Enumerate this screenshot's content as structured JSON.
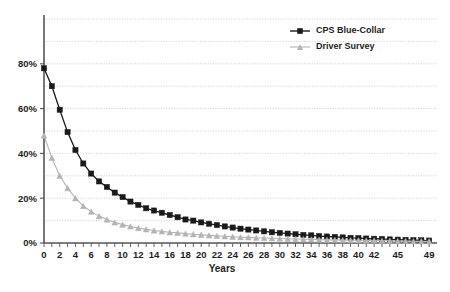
{
  "chart_data": {
    "type": "line",
    "title": "",
    "xlabel": "Years",
    "ylabel": "",
    "xlim": [
      0,
      50
    ],
    "ylim": [
      0,
      100
    ],
    "grid": true,
    "legend_position": "top-right",
    "x_tick_labels": [
      "0",
      "2",
      "4",
      "6",
      "8",
      "10",
      "12",
      "14",
      "16",
      "18",
      "20",
      "22",
      "24",
      "26",
      "28",
      "30",
      "32",
      "34",
      "36",
      "38",
      "40",
      "42",
      "45",
      "49"
    ],
    "x_tick_values": [
      0,
      2,
      4,
      6,
      8,
      10,
      12,
      14,
      16,
      18,
      20,
      22,
      24,
      26,
      28,
      30,
      32,
      34,
      36,
      38,
      40,
      42,
      45,
      49
    ],
    "y_tick_labels": [
      "0%",
      "20%",
      "40%",
      "60%",
      "80%"
    ],
    "y_tick_values": [
      0,
      20,
      40,
      60,
      80
    ],
    "y_minor_gridlines": [
      10,
      30,
      50,
      70,
      90,
      100
    ],
    "x": [
      0,
      1,
      2,
      3,
      4,
      5,
      6,
      7,
      8,
      9,
      10,
      11,
      12,
      13,
      14,
      15,
      16,
      17,
      18,
      19,
      20,
      21,
      22,
      23,
      24,
      25,
      26,
      27,
      28,
      29,
      30,
      31,
      32,
      33,
      34,
      35,
      36,
      37,
      38,
      39,
      40,
      41,
      42,
      43,
      44,
      45,
      46,
      47,
      48,
      49
    ],
    "series": [
      {
        "name": "CPS Blue-Collar",
        "color": "#1a1a1a",
        "marker": "square",
        "values": [
          78.0,
          70.0,
          59.5,
          49.5,
          41.5,
          35.5,
          31.0,
          27.5,
          25.0,
          22.5,
          20.5,
          18.5,
          17.0,
          15.5,
          14.5,
          13.5,
          12.5,
          11.5,
          10.5,
          10.0,
          9.2,
          8.6,
          8.0,
          7.4,
          6.9,
          6.4,
          6.0,
          5.6,
          5.2,
          4.8,
          4.5,
          4.2,
          3.9,
          3.6,
          3.4,
          3.1,
          2.9,
          2.7,
          2.5,
          2.3,
          2.2,
          2.0,
          1.9,
          1.8,
          1.6,
          1.5,
          1.4,
          1.3,
          1.2,
          1.1
        ]
      },
      {
        "name": "Driver Survey",
        "color": "#b4b4b4",
        "marker": "triangle",
        "values": [
          48.0,
          38.0,
          30.0,
          24.5,
          20.0,
          16.5,
          14.0,
          12.0,
          10.5,
          9.2,
          8.2,
          7.4,
          6.7,
          6.1,
          5.6,
          5.2,
          4.8,
          4.5,
          4.2,
          3.9,
          3.7,
          3.4,
          3.2,
          3.0,
          2.8,
          2.6,
          2.5,
          2.3,
          2.2,
          2.1,
          2.0,
          1.9,
          1.8,
          1.7,
          1.6,
          1.5,
          1.4,
          1.4,
          1.3,
          1.2,
          1.2,
          1.1,
          1.1,
          1.0,
          1.0,
          0.9,
          0.9,
          0.8,
          0.8,
          0.8
        ]
      }
    ],
    "legend": [
      {
        "label": "CPS Blue-Collar",
        "color": "#1a1a1a",
        "marker": "square"
      },
      {
        "label": "Driver Survey",
        "color": "#b4b4b4",
        "marker": "triangle"
      }
    ]
  }
}
